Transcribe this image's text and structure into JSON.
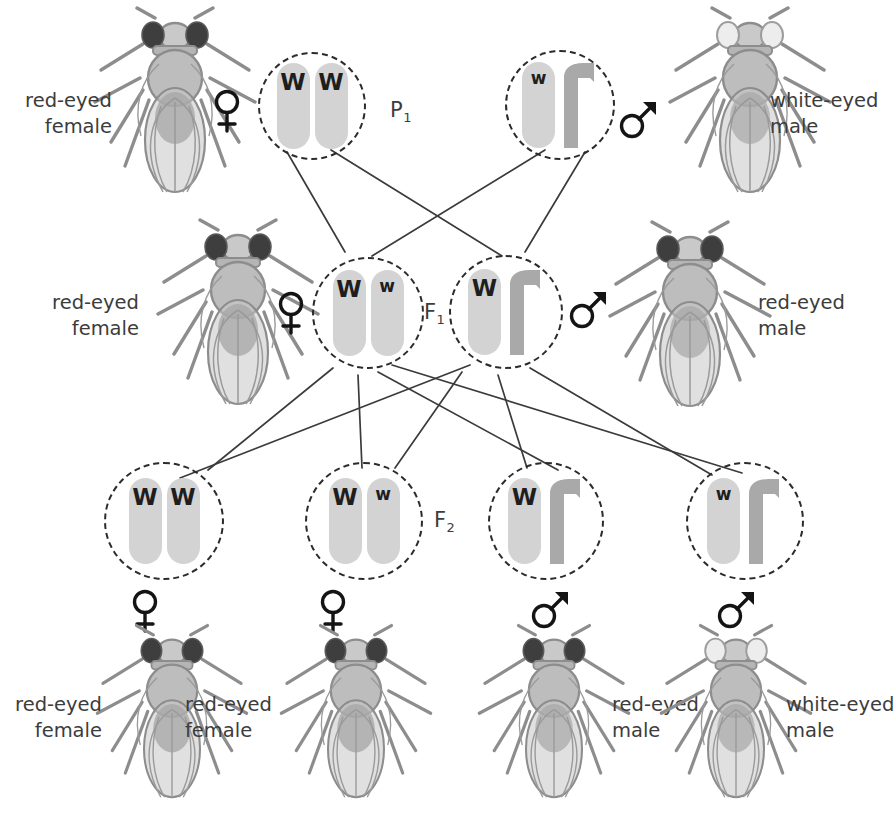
{
  "diagram": {
    "colors": {
      "x_chromosome": "#d3d3d3",
      "y_chromosome": "#a9a9a9",
      "line": "#3b3b3b",
      "text": "#3c3c3c",
      "fly_body": "#b8b8b8",
      "fly_outline": "#8a8a8a",
      "red_eye": "#3a3a3a",
      "white_eye": "#e8e8e8"
    }
  },
  "generations": [
    {
      "id": "p1",
      "label": "P",
      "subscript": "1"
    },
    {
      "id": "f1",
      "label": "F",
      "subscript": "1"
    },
    {
      "id": "f2",
      "label": "F",
      "subscript": "2"
    }
  ],
  "p1": {
    "female": {
      "phenotype_line1": "red-eyed",
      "phenotype_line2": "female",
      "sex": "female",
      "sex_symbol": "venus",
      "genotype": "WW",
      "alleles": [
        {
          "symbol": "W",
          "type": "dominant",
          "chromosome": "X"
        },
        {
          "symbol": "W",
          "type": "dominant",
          "chromosome": "X"
        }
      ]
    },
    "male": {
      "phenotype_line1": "white-eyed",
      "phenotype_line2": "male",
      "sex": "male",
      "sex_symbol": "mars",
      "genotype": "wY",
      "alleles": [
        {
          "symbol": "w",
          "type": "recessive",
          "chromosome": "X"
        },
        {
          "symbol": "",
          "type": "none",
          "chromosome": "Y"
        }
      ]
    }
  },
  "f1": {
    "female": {
      "phenotype_line1": "red-eyed",
      "phenotype_line2": "female",
      "sex": "female",
      "sex_symbol": "venus",
      "genotype": "Ww",
      "alleles": [
        {
          "symbol": "W",
          "type": "dominant",
          "chromosome": "X"
        },
        {
          "symbol": "w",
          "type": "recessive",
          "chromosome": "X"
        }
      ]
    },
    "male": {
      "phenotype_line1": "red-eyed",
      "phenotype_line2": "male",
      "sex": "male",
      "sex_symbol": "mars",
      "genotype": "WY",
      "alleles": [
        {
          "symbol": "W",
          "type": "dominant",
          "chromosome": "X"
        },
        {
          "symbol": "",
          "type": "none",
          "chromosome": "Y"
        }
      ]
    }
  },
  "f2": {
    "offspring": [
      {
        "genotype": "WW",
        "alleles": [
          {
            "symbol": "W",
            "type": "dominant",
            "chromosome": "X"
          },
          {
            "symbol": "W",
            "type": "dominant",
            "chromosome": "X"
          }
        ],
        "sex": "female",
        "sex_symbol": "venus",
        "phenotype_line1": "red-eyed",
        "phenotype_line2": "female"
      },
      {
        "genotype": "Ww",
        "alleles": [
          {
            "symbol": "W",
            "type": "dominant",
            "chromosome": "X"
          },
          {
            "symbol": "w",
            "type": "recessive",
            "chromosome": "X"
          }
        ],
        "sex": "female",
        "sex_symbol": "venus",
        "phenotype_line1": "red-eyed",
        "phenotype_line2": "female"
      },
      {
        "genotype": "WY",
        "alleles": [
          {
            "symbol": "W",
            "type": "dominant",
            "chromosome": "X"
          },
          {
            "symbol": "",
            "type": "none",
            "chromosome": "Y"
          }
        ],
        "sex": "male",
        "sex_symbol": "mars",
        "phenotype_line1": "red-eyed",
        "phenotype_line2": "male"
      },
      {
        "genotype": "wY",
        "alleles": [
          {
            "symbol": "w",
            "type": "recessive",
            "chromosome": "X"
          },
          {
            "symbol": "",
            "type": "none",
            "chromosome": "Y"
          }
        ],
        "sex": "male",
        "sex_symbol": "mars",
        "phenotype_line1": "white-eyed",
        "phenotype_line2": "male"
      }
    ]
  }
}
